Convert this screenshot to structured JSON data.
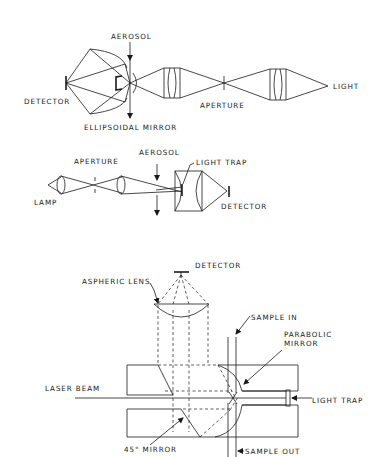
{
  "figure": {
    "panels": [
      {
        "id": "ellipsoidal-mirror-setup",
        "labels": {
          "aerosol": "AEROSOL",
          "detector": "DETECTOR",
          "ellipsoidal_mirror": "ELLIPSOIDAL MIRROR",
          "aperture": "APERTURE",
          "light": "LIGHT"
        }
      },
      {
        "id": "light-trap-setup",
        "labels": {
          "aperture": "APERTURE",
          "aerosol": "AEROSOL",
          "light_trap": "LIGHT TRAP",
          "lamp": "LAMP",
          "detector": "DETECTOR"
        }
      },
      {
        "id": "laser-parabolic-setup",
        "labels": {
          "detector": "DETECTOR",
          "aspheric_lens": "ASPHERIC LENS",
          "sample_in": "SAMPLE IN",
          "parabolic_mirror_1": "PARABOLIC",
          "parabolic_mirror_2": "MIRROR",
          "laser_beam": "LASER BEAM",
          "light_trap": "LIGHT TRAP",
          "mirror_45": "45° MIRROR",
          "sample_out": "SAMPLE OUT"
        }
      }
    ]
  }
}
